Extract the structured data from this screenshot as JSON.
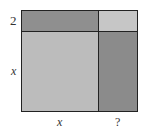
{
  "diagram": {
    "type": "area-model",
    "labels": {
      "top_strip_height": "2",
      "left_side": "x",
      "bottom_left_width": "x",
      "bottom_right_width": "?"
    },
    "regions": [
      {
        "name": "top-left",
        "color": "#8f8f8f"
      },
      {
        "name": "top-right",
        "color": "#c6c6c6"
      },
      {
        "name": "bottom-left",
        "color": "#bcbcbc"
      },
      {
        "name": "bottom-right",
        "color": "#8b8b8b"
      }
    ]
  }
}
